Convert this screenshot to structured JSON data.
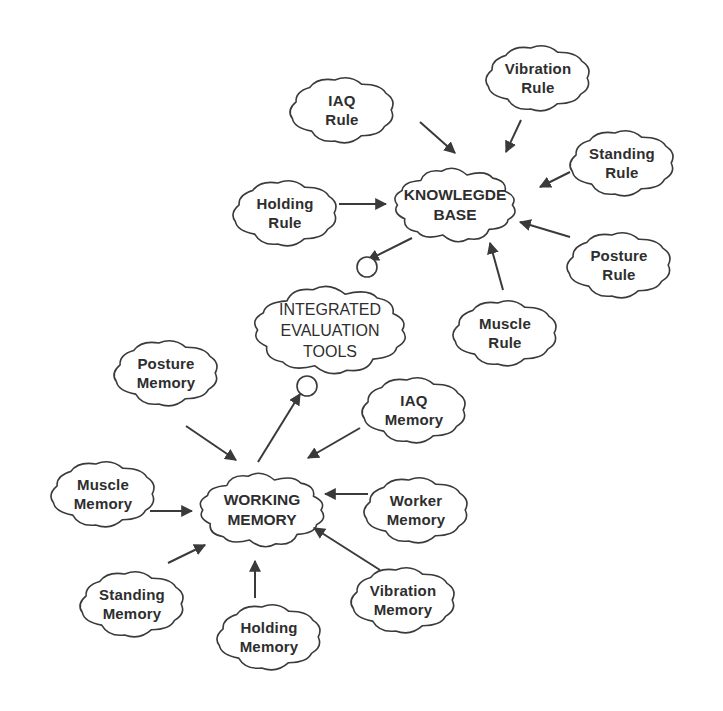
{
  "diagram": {
    "stroke_color": "#3a3a3a",
    "background": "#ffffff",
    "nodes": {
      "knowledge_base": {
        "line1": "KNOWLEGDE",
        "line2": "BASE",
        "x": 455,
        "y": 205,
        "rx": 70,
        "ry": 42,
        "type": "hub"
      },
      "integrated_tools": {
        "line1": "INTEGRATED",
        "line2": "EVALUATION",
        "line3": "TOOLS",
        "x": 330,
        "y": 330,
        "rx": 88,
        "ry": 50,
        "type": "hub"
      },
      "working_memory": {
        "line1": "WORKING",
        "line2": "MEMORY",
        "x": 262,
        "y": 510,
        "rx": 72,
        "ry": 42,
        "type": "hub"
      },
      "iaq_rule": {
        "line1": "IAQ",
        "line2": "Rule",
        "x": 342,
        "y": 110,
        "rx": 60,
        "ry": 38
      },
      "vibration_rule": {
        "line1": "Vibration",
        "line2": "Rule",
        "x": 538,
        "y": 78,
        "rx": 60,
        "ry": 38
      },
      "standing_rule": {
        "line1": "Standing",
        "line2": "Rule",
        "x": 622,
        "y": 163,
        "rx": 60,
        "ry": 38
      },
      "holding_rule": {
        "line1": "Holding",
        "line2": "Rule",
        "x": 285,
        "y": 213,
        "rx": 60,
        "ry": 38
      },
      "posture_rule": {
        "line1": "Posture",
        "line2": "Rule",
        "x": 619,
        "y": 265,
        "rx": 60,
        "ry": 38
      },
      "muscle_rule": {
        "line1": "Muscle",
        "line2": "Rule",
        "x": 505,
        "y": 333,
        "rx": 60,
        "ry": 38
      },
      "posture_memory": {
        "line1": "Posture",
        "line2": "Memory",
        "x": 166,
        "y": 373,
        "rx": 60,
        "ry": 38
      },
      "iaq_memory": {
        "line1": "IAQ",
        "line2": "Memory",
        "x": 414,
        "y": 410,
        "rx": 60,
        "ry": 38
      },
      "muscle_memory": {
        "line1": "Muscle",
        "line2": "Memory",
        "x": 103,
        "y": 494,
        "rx": 60,
        "ry": 38
      },
      "worker_memory": {
        "line1": "Worker",
        "line2": "Memory",
        "x": 416,
        "y": 510,
        "rx": 60,
        "ry": 38
      },
      "standing_memory": {
        "line1": "Standing",
        "line2": "Memory",
        "x": 132,
        "y": 604,
        "rx": 60,
        "ry": 38
      },
      "holding_memory": {
        "line1": "Holding",
        "line2": "Memory",
        "x": 269,
        "y": 637,
        "rx": 60,
        "ry": 38
      },
      "vibration_memory": {
        "line1": "Vibration",
        "line2": "Memory",
        "x": 403,
        "y": 600,
        "rx": 60,
        "ry": 38
      }
    },
    "edges": [
      {
        "from": "iaq_rule",
        "to": "knowledge_base",
        "x1": 420,
        "y1": 122,
        "x2": 455,
        "y2": 153
      },
      {
        "from": "vibration_rule",
        "to": "knowledge_base",
        "x1": 521,
        "y1": 120,
        "x2": 506,
        "y2": 152
      },
      {
        "from": "standing_rule",
        "to": "knowledge_base",
        "x1": 570,
        "y1": 172,
        "x2": 540,
        "y2": 187
      },
      {
        "from": "holding_rule",
        "to": "knowledge_base",
        "x1": 339,
        "y1": 204,
        "x2": 386,
        "y2": 204
      },
      {
        "from": "posture_rule",
        "to": "knowledge_base",
        "x1": 570,
        "y1": 237,
        "x2": 520,
        "y2": 222
      },
      {
        "from": "muscle_rule",
        "to": "knowledge_base",
        "x1": 503,
        "y1": 290,
        "x2": 490,
        "y2": 243
      },
      {
        "from": "knowledge_base",
        "to": "integrated_tools",
        "x1": 412,
        "y1": 238,
        "x2": 368,
        "y2": 260
      },
      {
        "from": "working_memory",
        "to": "integrated_tools",
        "x1": 258,
        "y1": 462,
        "x2": 300,
        "y2": 394
      },
      {
        "from": "posture_memory",
        "to": "working_memory",
        "x1": 186,
        "y1": 426,
        "x2": 236,
        "y2": 460
      },
      {
        "from": "iaq_memory",
        "to": "working_memory",
        "x1": 360,
        "y1": 428,
        "x2": 308,
        "y2": 458
      },
      {
        "from": "muscle_memory",
        "to": "working_memory",
        "x1": 150,
        "y1": 511,
        "x2": 192,
        "y2": 511
      },
      {
        "from": "worker_memory",
        "to": "working_memory",
        "x1": 368,
        "y1": 494,
        "x2": 325,
        "y2": 494
      },
      {
        "from": "standing_memory",
        "to": "working_memory",
        "x1": 168,
        "y1": 563,
        "x2": 205,
        "y2": 545
      },
      {
        "from": "holding_memory",
        "to": "working_memory",
        "x1": 255,
        "y1": 598,
        "x2": 255,
        "y2": 561
      },
      {
        "from": "vibration_memory",
        "to": "working_memory",
        "x1": 380,
        "y1": 570,
        "x2": 314,
        "y2": 528
      }
    ],
    "bubbles": [
      {
        "name": "kb-output-bubble",
        "x": 367,
        "y": 267,
        "r": 10
      },
      {
        "name": "wm-output-bubble",
        "x": 307,
        "y": 386,
        "r": 10
      }
    ]
  }
}
